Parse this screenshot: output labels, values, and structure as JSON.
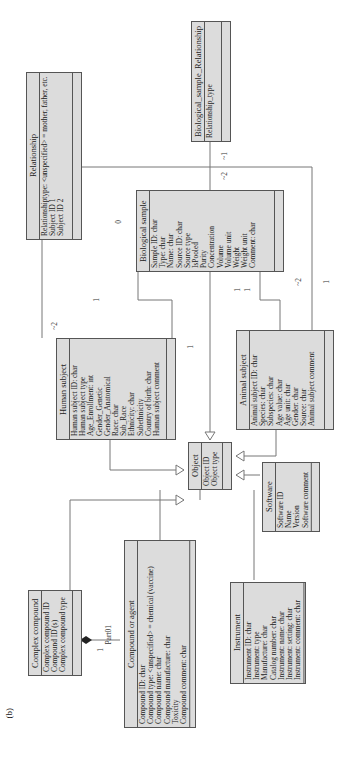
{
  "figure_label": "(b)",
  "classes": {
    "bio_rel": {
      "name": "Biological_sample_Relationship",
      "attrs": [
        "Relationship_type"
      ]
    },
    "relationship": {
      "name": "Relationship",
      "attrs": [
        "Relationshiptype: <unspecified> = mother, father, etc.",
        "Subject ID 1",
        "Subject ID 2"
      ]
    },
    "bio_sample": {
      "name": "Biological sample",
      "attrs": [
        "Sample ID: char",
        "Type: char",
        "Name: char",
        "Source ID: char",
        "Source type",
        "IsPooled",
        "Purity",
        "Concentration",
        "Volume",
        "Volume unit",
        "Weight",
        "Weight unit",
        "Comment: char"
      ]
    },
    "human": {
      "name": "Human subject",
      "attrs": [
        "Human subject ID: char",
        "Human subject type",
        "Age_Enrollment: int",
        "Gender_Genetic",
        "Gender_Anatomical",
        "Race: char",
        "Sub_Race",
        "Ethnicity: char",
        "Subethnicity",
        "Country of birth: char",
        "Human subject comment"
      ]
    },
    "animal": {
      "name": "Animal subject",
      "attrs": [
        "Animal subject ID: char",
        "Species: char",
        "Subspecies: char",
        "Age value: char",
        "Age unit: char",
        "Gender: char",
        "Source: char",
        "Animal subject comment"
      ]
    },
    "object": {
      "name": "Object",
      "attrs": [
        "Object ID",
        "Object type"
      ]
    },
    "software": {
      "name": "Software",
      "attrs": [
        "Software ID",
        "Name",
        "Version",
        "Software comment"
      ]
    },
    "complex": {
      "name": "Complex compound",
      "attrs": [
        "Complex compound ID",
        "Compound ID (s)",
        "Complex compound type"
      ]
    },
    "compound": {
      "name": "Compound or agent",
      "attrs": [
        "Compound ID: char",
        "Compound type: <unspecified> = chemical (vaccine)",
        "Compound name: char",
        "Compound manufacture: char",
        "Toxicity",
        "Compound comment: char"
      ]
    },
    "instrument": {
      "name": "Instrument",
      "attrs": [
        "Instrument ID: char",
        "Instrument: type",
        "Manufacture: char",
        "Catalog number: char",
        "Instrument: name: char",
        "Instrument: setting: char",
        "Instrument: comment: char"
      ]
    }
  },
  "labels": {
    "bio_rel_mult_1": "~1",
    "bio_rel_mult_2": "~2",
    "rel_human_mult": "~2",
    "human_bio_mult": "1",
    "bio_zero": "0",
    "bio_human_mult": "1",
    "bio_animal_mult_1": "1",
    "bio_animal_mult_2": "1",
    "animal_bio_mult": "~2",
    "rel_animal_mult": "1",
    "part_label": "Part01",
    "part_mult": "1"
  }
}
